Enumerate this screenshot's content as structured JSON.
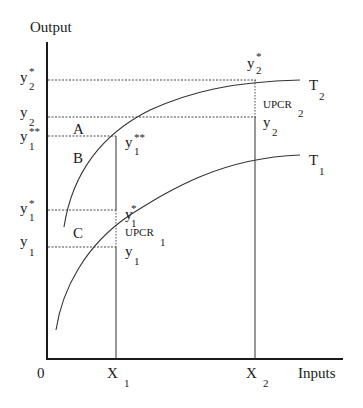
{
  "diagram": {
    "y_axis_label": "Output",
    "x_axis_label": "Inputs",
    "origin_label": "0",
    "x_ticks": [
      {
        "main": "X",
        "sub": "1"
      },
      {
        "main": "X",
        "sub": "2"
      }
    ],
    "y_ticks": [
      {
        "main": "y",
        "sup": "*",
        "sub": "2"
      },
      {
        "main": "y",
        "sup": "",
        "sub": "2"
      },
      {
        "main": "y",
        "sup": "**",
        "sub": "1"
      },
      {
        "main": "y",
        "sup": "*",
        "sub": "1"
      },
      {
        "main": "y",
        "sup": "",
        "sub": "1"
      }
    ],
    "curves": [
      {
        "name": "T",
        "sub": "2"
      },
      {
        "name": "T",
        "sub": "1"
      }
    ],
    "regions": [
      "A",
      "B",
      "C"
    ],
    "annotations": {
      "x2_top": {
        "main": "y",
        "sup": "*",
        "sub": "2"
      },
      "upcr2": {
        "main": "UPCR",
        "sub": "2"
      },
      "x2_y2": {
        "main": "y",
        "sub": "2"
      },
      "x1_y1ss": {
        "main": "y",
        "sup": "**",
        "sub": "1"
      },
      "x1_y1s": {
        "main": "y",
        "sup": "*",
        "sub": "1"
      },
      "upcr1": {
        "main": "UPCR",
        "sub": "1"
      },
      "x1_y1": {
        "main": "y",
        "sub": "1"
      }
    }
  }
}
